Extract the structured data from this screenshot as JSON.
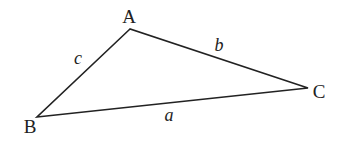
{
  "diagram": {
    "type": "triangle",
    "stroke_color": "#222222",
    "vertices": [
      {
        "id": "A",
        "label": "A",
        "x": 130,
        "y": 29,
        "label_x": 129,
        "label_y": 23
      },
      {
        "id": "B",
        "label": "B",
        "x": 37,
        "y": 117,
        "label_x": 30,
        "label_y": 133
      },
      {
        "id": "C",
        "label": "C",
        "x": 308,
        "y": 88,
        "label_x": 319,
        "label_y": 98
      }
    ],
    "sides": [
      {
        "id": "a",
        "label": "a",
        "from": "B",
        "to": "C",
        "label_x": 169,
        "label_y": 121
      },
      {
        "id": "b",
        "label": "b",
        "from": "A",
        "to": "C",
        "label_x": 219,
        "label_y": 51
      },
      {
        "id": "c",
        "label": "c",
        "from": "A",
        "to": "B",
        "label_x": 78,
        "label_y": 64
      }
    ]
  }
}
